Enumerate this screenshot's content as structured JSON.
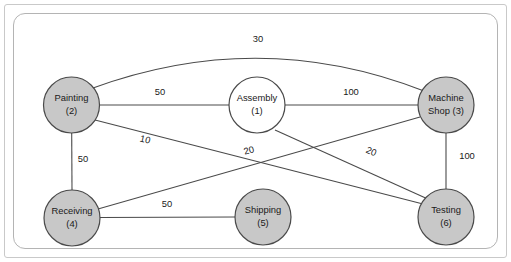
{
  "diagram": {
    "background_color": "#ffffff",
    "node_shaded_color": "#c8c8c8",
    "node_plain_color": "#ffffff",
    "line_color": "#4a4a4a",
    "nodes": [
      {
        "id": "painting",
        "label_line1": "Painting",
        "label_line2": "(2)",
        "number": "2",
        "cx": 71.5,
        "cy": 105,
        "r": 28,
        "style": "shaded",
        "two_line": true
      },
      {
        "id": "assembly",
        "label_line1": "Assembly",
        "label_line2": "(1)",
        "number": "1",
        "cx": 257,
        "cy": 105,
        "r": 28,
        "style": "plain",
        "two_line": true
      },
      {
        "id": "machine-shop",
        "label_line1": "Machine",
        "label_line2": "Shop (3)",
        "number": "3",
        "cx": 446,
        "cy": 105,
        "r": 28,
        "style": "shaded",
        "two_line": true
      },
      {
        "id": "receiving",
        "label_line1": "Receiving",
        "label_line2": "(4)",
        "number": "4",
        "cx": 72,
        "cy": 218,
        "r": 28,
        "style": "shaded",
        "two_line": true
      },
      {
        "id": "shipping",
        "label_line1": "Shipping",
        "label_line2": "(5)",
        "number": "5",
        "cx": 263,
        "cy": 217,
        "r": 28,
        "style": "shaded",
        "two_line": true
      },
      {
        "id": "testing",
        "label_line1": "Testing",
        "label_line2": "(6)",
        "number": "6",
        "cx": 446,
        "cy": 217,
        "r": 28,
        "style": "shaded",
        "two_line": true
      }
    ],
    "edges": [
      {
        "id": "painting-machineshop",
        "from": "painting",
        "to": "machine-shop",
        "weight": "30",
        "shape": "curve",
        "path": "M 93 88 Q 260 27 424 91",
        "label_x": 258,
        "label_y": 40,
        "label_rotation": 0
      },
      {
        "id": "painting-assembly",
        "from": "painting",
        "to": "assembly",
        "weight": "50",
        "shape": "line",
        "path": "M 99.5 105 L 229 105",
        "label_x": 160,
        "label_y": 93,
        "label_rotation": 0
      },
      {
        "id": "assembly-machineshop",
        "from": "assembly",
        "to": "machine-shop",
        "weight": "100",
        "shape": "line",
        "path": "M 285 105 L 418 105",
        "label_x": 351,
        "label_y": 93,
        "label_rotation": 0
      },
      {
        "id": "painting-receiving",
        "from": "painting",
        "to": "receiving",
        "weight": "50",
        "shape": "line",
        "path": "M 71.7 133 L 72 190",
        "label_x": 83,
        "label_y": 160,
        "label_rotation": 0
      },
      {
        "id": "painting-testing",
        "from": "painting",
        "to": "testing",
        "weight": "10",
        "shape": "line",
        "path": "M 95 120 L 423 204",
        "label_x": 145,
        "label_y": 140,
        "label_rotation": 14
      },
      {
        "id": "receiving-machineshop",
        "from": "receiving",
        "to": "machine-shop",
        "weight": "20",
        "shape": "line",
        "path": "M 98 209 L 420 117",
        "label_x": 249,
        "label_y": 151,
        "label_rotation": -16
      },
      {
        "id": "assembly-shipping",
        "from": "assembly",
        "to": "shipping",
        "weight": "20",
        "shape": "line",
        "path": "M 275 130 L 430 200",
        "label_x": 371,
        "label_y": 152,
        "label_rotation": 24
      },
      {
        "id": "receiving-shipping",
        "from": "receiving",
        "to": "shipping",
        "weight": "50",
        "shape": "line",
        "path": "M 100 217.5 L 235 217",
        "label_x": 167,
        "label_y": 205,
        "label_rotation": 0
      },
      {
        "id": "machineshop-testing",
        "from": "machine-shop",
        "to": "testing",
        "weight": "100",
        "shape": "line",
        "path": "M 446 133 L 446 190",
        "label_x": 467,
        "label_y": 157,
        "label_rotation": 0
      }
    ]
  }
}
